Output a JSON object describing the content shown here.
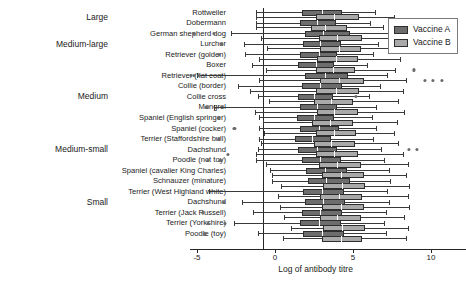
{
  "chart_data": {
    "type": "boxplot",
    "title": "",
    "xlabel": "Log of antibody titre",
    "ylabel": "",
    "xlim": [
      -5.6,
      11.0
    ],
    "xticks": [
      -5,
      0,
      5,
      10
    ],
    "xticklabels": [
      "-5",
      "0",
      "5",
      "10"
    ],
    "grid": false,
    "legend_position": "top-right",
    "series": [
      {
        "name": "Vaccine A",
        "color": "#6d6d6d"
      },
      {
        "name": "Vaccine B",
        "color": "#a9a9a9"
      }
    ],
    "size_groups": [
      {
        "label": "Large",
        "breeds": [
          "Rottweiler",
          "Dobermann"
        ]
      },
      {
        "label": "Medium-large",
        "breeds": [
          "German shepherd dog",
          "Lurcher",
          "Retriever (golden)"
        ]
      },
      {
        "label": "Medium",
        "breeds": [
          "Boxer",
          "Retriever (flat coat)",
          "Collie (border)",
          "Collie cross",
          "Mongrel",
          "Spaniel (English springer)",
          "Spaniel (cocker)"
        ]
      },
      {
        "label": "Medium-small",
        "breeds": [
          "Terrier (Staffordshire bull)",
          "Dachshund",
          "Poodle (not toy)"
        ]
      },
      {
        "label": "Small",
        "breeds": [
          "Spaniel (cavalier King Charles)",
          "Schnauzer (minature)",
          "Terrier (West Highland white)",
          "Dachshund",
          "Terrier (Jack Russell)",
          "Terrier (Yorkshire)",
          "Poodle (toy)"
        ]
      }
    ],
    "categories": [
      "Rottweiler",
      "Dobermann",
      "German shepherd dog",
      "Lurcher",
      "Retriever (golden)",
      "Boxer",
      "Retriever (flat coat)",
      "Collie (border)",
      "Collie cross",
      "Mongrel",
      "Spaniel (English springer)",
      "Spaniel (cocker)",
      "Terrier (Staffordshire bull)",
      "Dachshund",
      "Poodle (not toy)",
      "Spaniel (cavalier King Charles)",
      "Schnauzer (minature)",
      "Terrier (West Highland white)",
      "Dachshund",
      "Terrier (Jack Russell)",
      "Terrier (Yorkshire)",
      "Poodle (toy)"
    ],
    "boxes": [
      {
        "category": "Rottweiler",
        "series": "Vaccine A",
        "whisker_low": -1.2,
        "q1": 1.7,
        "median": 3.0,
        "q3": 4.3,
        "whisker_high": 6.4,
        "outliers": []
      },
      {
        "category": "Rottweiler",
        "series": "Vaccine B",
        "whisker_low": -1.2,
        "q1": 2.6,
        "median": 3.8,
        "q3": 5.4,
        "whisker_high": 7.6,
        "outliers": []
      },
      {
        "category": "Dobermann",
        "series": "Vaccine A",
        "whisker_low": -1.2,
        "q1": 1.6,
        "median": 2.7,
        "q3": 3.9,
        "whisker_high": 6.1,
        "outliers": [
          10.7
        ]
      },
      {
        "category": "Dobermann",
        "series": "Vaccine B",
        "whisker_low": -1.2,
        "q1": 2.3,
        "median": 3.2,
        "q3": 4.6,
        "whisker_high": 6.9,
        "outliers": []
      },
      {
        "category": "German shepherd dog",
        "series": "Vaccine A",
        "whisker_low": -2.8,
        "q1": 1.9,
        "median": 3.1,
        "q3": 4.8,
        "whisker_high": 7.3,
        "outliers": [
          -5.2,
          -3.9
        ]
      },
      {
        "category": "German shepherd dog",
        "series": "Vaccine B",
        "whisker_low": -0.9,
        "q1": 2.8,
        "median": 4.0,
        "q3": 5.6,
        "whisker_high": 8.1,
        "outliers": [
          10.7
        ]
      },
      {
        "category": "Lurcher",
        "series": "Vaccine A",
        "whisker_low": -2.0,
        "q1": 1.8,
        "median": 2.9,
        "q3": 4.2,
        "whisker_high": 6.6,
        "outliers": [
          -3.4
        ]
      },
      {
        "category": "Lurcher",
        "series": "Vaccine B",
        "whisker_low": -0.5,
        "q1": 2.9,
        "median": 4.1,
        "q3": 5.5,
        "whisker_high": 8.3,
        "outliers": [
          10.6,
          11.0
        ]
      },
      {
        "category": "Retriever (golden)",
        "series": "Vaccine A",
        "whisker_low": -1.9,
        "q1": 1.6,
        "median": 2.8,
        "q3": 4.0,
        "whisker_high": 6.3,
        "outliers": [
          -3.6
        ]
      },
      {
        "category": "Retriever (golden)",
        "series": "Vaccine B",
        "whisker_low": -1.0,
        "q1": 2.7,
        "median": 3.9,
        "q3": 5.3,
        "whisker_high": 8.0,
        "outliers": []
      },
      {
        "category": "Boxer",
        "series": "Vaccine A",
        "whisker_low": -1.5,
        "q1": 1.5,
        "median": 2.6,
        "q3": 3.8,
        "whisker_high": 5.9,
        "outliers": []
      },
      {
        "category": "Boxer",
        "series": "Vaccine B",
        "whisker_low": -0.6,
        "q1": 2.6,
        "median": 3.7,
        "q3": 5.1,
        "whisker_high": 7.7,
        "outliers": [
          8.9
        ]
      },
      {
        "category": "Retriever (flat coat)",
        "series": "Vaccine A",
        "whisker_low": -5.0,
        "q1": 1.9,
        "median": 3.2,
        "q3": 4.7,
        "whisker_high": 7.2,
        "outliers": [
          -5.4,
          -5.2,
          -4.9
        ]
      },
      {
        "category": "Retriever (flat coat)",
        "series": "Vaccine B",
        "whisker_low": -1.0,
        "q1": 2.9,
        "median": 4.1,
        "q3": 5.7,
        "whisker_high": 8.4,
        "outliers": [
          9.6,
          10.1,
          10.7
        ]
      },
      {
        "category": "Collie (border)",
        "series": "Vaccine A",
        "whisker_low": -2.4,
        "q1": 1.7,
        "median": 2.9,
        "q3": 4.3,
        "whisker_high": 6.7,
        "outliers": []
      },
      {
        "category": "Collie (border)",
        "series": "Vaccine B",
        "whisker_low": -1.6,
        "q1": 2.6,
        "median": 3.9,
        "q3": 5.4,
        "whisker_high": 8.2,
        "outliers": []
      },
      {
        "category": "Collie cross",
        "series": "Vaccine A",
        "whisker_low": -1.1,
        "q1": 1.5,
        "median": 2.5,
        "q3": 3.7,
        "whisker_high": 6.0,
        "outliers": [
          5.2
        ]
      },
      {
        "category": "Collie cross",
        "series": "Vaccine B",
        "whisker_low": -0.4,
        "q1": 2.5,
        "median": 3.6,
        "q3": 5.0,
        "whisker_high": 7.9,
        "outliers": []
      },
      {
        "category": "Mongrel",
        "series": "Vaccine A",
        "whisker_low": -3.9,
        "q1": 1.6,
        "median": 2.7,
        "q3": 4.0,
        "whisker_high": 6.5,
        "outliers": [
          -4.4
        ]
      },
      {
        "category": "Mongrel",
        "series": "Vaccine B",
        "whisker_low": -1.3,
        "q1": 2.7,
        "median": 3.8,
        "q3": 5.3,
        "whisker_high": 8.3,
        "outliers": []
      },
      {
        "category": "Spaniel (English springer)",
        "series": "Vaccine A",
        "whisker_low": -1.0,
        "q1": 1.4,
        "median": 2.5,
        "q3": 3.8,
        "whisker_high": 6.2,
        "outliers": [
          -3.6
        ]
      },
      {
        "category": "Spaniel (English springer)",
        "series": "Vaccine B",
        "whisker_low": -0.8,
        "q1": 2.4,
        "median": 3.5,
        "q3": 5.0,
        "whisker_high": 7.8,
        "outliers": []
      },
      {
        "category": "Spaniel (cocker)",
        "series": "Vaccine A",
        "whisker_low": -1.0,
        "q1": 1.6,
        "median": 2.8,
        "q3": 4.1,
        "whisker_high": 6.5,
        "outliers": [
          -2.6
        ]
      },
      {
        "category": "Spaniel (cocker)",
        "series": "Vaccine B",
        "whisker_low": -0.7,
        "q1": 2.6,
        "median": 3.8,
        "q3": 5.2,
        "whisker_high": 7.6,
        "outliers": []
      },
      {
        "category": "Terrier (Staffordshire bull)",
        "series": "Vaccine A",
        "whisker_low": -1.0,
        "q1": 1.3,
        "median": 2.4,
        "q3": 3.6,
        "whisker_high": 6.3,
        "outliers": [
          -3.6
        ]
      },
      {
        "category": "Terrier (Staffordshire bull)",
        "series": "Vaccine B",
        "whisker_low": -0.9,
        "q1": 2.5,
        "median": 3.6,
        "q3": 5.1,
        "whisker_high": 7.9,
        "outliers": []
      },
      {
        "category": "Dachshund",
        "series": "Vaccine A",
        "whisker_low": -1.1,
        "q1": 1.5,
        "median": 2.7,
        "q3": 4.0,
        "whisker_high": 6.8,
        "outliers": [
          8.6,
          9.1
        ]
      },
      {
        "category": "Dachshund",
        "series": "Vaccine B",
        "whisker_low": -1.2,
        "q1": 2.6,
        "median": 3.8,
        "q3": 5.3,
        "whisker_high": 8.2,
        "outliers": [
          -3.0
        ]
      },
      {
        "category": "Poodle (not toy)",
        "series": "Vaccine A",
        "whisker_low": -1.2,
        "q1": 1.7,
        "median": 2.9,
        "q3": 4.2,
        "whisker_high": 7.0,
        "outliers": [
          -4.3,
          -3.5
        ]
      },
      {
        "category": "Poodle (not toy)",
        "series": "Vaccine B",
        "whisker_low": -0.6,
        "q1": 2.8,
        "median": 4.0,
        "q3": 5.5,
        "whisker_high": 8.5,
        "outliers": []
      },
      {
        "category": "Spaniel (cavalier King Charles)",
        "series": "Vaccine A",
        "whisker_low": -0.3,
        "q1": 2.0,
        "median": 3.2,
        "q3": 4.6,
        "whisker_high": 7.3,
        "outliers": []
      },
      {
        "category": "Spaniel (cavalier King Charles)",
        "series": "Vaccine B",
        "whisker_low": -0.2,
        "q1": 3.0,
        "median": 4.2,
        "q3": 5.7,
        "whisker_high": 8.4,
        "outliers": []
      },
      {
        "category": "Schnauzer (minature)",
        "series": "Vaccine A",
        "whisker_low": -0.2,
        "q1": 2.1,
        "median": 3.3,
        "q3": 4.8,
        "whisker_high": 7.4,
        "outliers": []
      },
      {
        "category": "Schnauzer (minature)",
        "series": "Vaccine B",
        "whisker_low": 0.4,
        "q1": 3.1,
        "median": 4.3,
        "q3": 5.8,
        "whisker_high": 8.6,
        "outliers": []
      },
      {
        "category": "Terrier (West Highland white)",
        "series": "Vaccine A",
        "whisker_low": -4.2,
        "q1": 1.8,
        "median": 3.0,
        "q3": 4.4,
        "whisker_high": 7.2,
        "outliers": []
      },
      {
        "category": "Terrier (West Highland white)",
        "series": "Vaccine B",
        "whisker_low": 0.2,
        "q1": 2.9,
        "median": 4.1,
        "q3": 5.6,
        "whisker_high": 8.5,
        "outliers": []
      },
      {
        "category": "Dachshund",
        "series": "Vaccine A",
        "whisker_low": -2.1,
        "q1": 1.9,
        "median": 3.1,
        "q3": 4.5,
        "whisker_high": 7.3,
        "outliers": [
          -3.3
        ]
      },
      {
        "category": "Dachshund",
        "series": "Vaccine B",
        "whisker_low": 0.3,
        "q1": 3.0,
        "median": 4.2,
        "q3": 5.7,
        "whisker_high": 8.6,
        "outliers": []
      },
      {
        "category": "Terrier (Jack Russell)",
        "series": "Vaccine A",
        "whisker_low": -1.4,
        "q1": 1.7,
        "median": 2.9,
        "q3": 4.3,
        "whisker_high": 7.1,
        "outliers": [
          -4.6
        ]
      },
      {
        "category": "Terrier (Jack Russell)",
        "series": "Vaccine B",
        "whisker_low": 0.6,
        "q1": 2.9,
        "median": 4.0,
        "q3": 5.5,
        "whisker_high": 8.3,
        "outliers": []
      },
      {
        "category": "Terrier (Yorkshire)",
        "series": "Vaccine A",
        "whisker_low": -2.6,
        "q1": 1.6,
        "median": 2.8,
        "q3": 4.2,
        "whisker_high": 7.0,
        "outliers": [
          -4.3,
          -3.2
        ]
      },
      {
        "category": "Terrier (Yorkshire)",
        "series": "Vaccine B",
        "whisker_low": 1.0,
        "q1": 3.1,
        "median": 4.3,
        "q3": 5.8,
        "whisker_high": 8.5,
        "outliers": []
      },
      {
        "category": "Poodle (toy)",
        "series": "Vaccine A",
        "whisker_low": -1.1,
        "q1": 1.8,
        "median": 3.0,
        "q3": 4.4,
        "whisker_high": 7.1,
        "outliers": [
          -4.5
        ]
      },
      {
        "category": "Poodle (toy)",
        "series": "Vaccine B",
        "whisker_low": 0.5,
        "q1": 3.0,
        "median": 4.2,
        "q3": 5.6,
        "whisker_high": 8.4,
        "outliers": []
      }
    ]
  },
  "legend": {
    "entries": [
      {
        "label": "Vaccine A"
      },
      {
        "label": "Vaccine B"
      }
    ]
  }
}
